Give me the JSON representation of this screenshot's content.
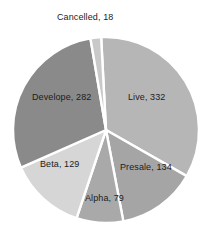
{
  "chart_data": {
    "type": "pie",
    "title": "",
    "subtitle": "",
    "xlabel": "",
    "ylabel": "",
    "legend_position": "none",
    "grid": false,
    "label_format": "category, value",
    "total": 974,
    "start_angle_deg": -3,
    "direction": "clockwise",
    "categories": [
      "Live",
      "Presale",
      "Alpha",
      "Beta",
      "Develope",
      "Cancelled"
    ],
    "values": [
      332,
      134,
      79,
      129,
      282,
      18
    ],
    "colors": [
      "#b6b6b6",
      "#a5a5a5",
      "#a9a9a9",
      "#d6d6d6",
      "#8a8a8a",
      "#c9c9c9"
    ],
    "slices": [
      {
        "name": "live-slice",
        "category": "Live",
        "value": 332,
        "label": "Live, 332",
        "color": "#b6b6b6",
        "label_x": 128,
        "label_y": 93
      },
      {
        "name": "presale-slice",
        "category": "Presale",
        "value": 134,
        "label": "Presale, 134",
        "color": "#a5a5a5",
        "label_x": 120,
        "label_y": 163
      },
      {
        "name": "alpha-slice",
        "category": "Alpha",
        "value": 79,
        "label": "Alpha, 79",
        "color": "#a9a9a9",
        "label_x": 85,
        "label_y": 194
      },
      {
        "name": "beta-slice",
        "category": "Beta",
        "value": 129,
        "label": "Beta, 129",
        "color": "#d6d6d6",
        "label_x": 40,
        "label_y": 160
      },
      {
        "name": "develope-slice",
        "category": "Develope",
        "value": 282,
        "label": "Develope, 282",
        "color": "#8a8a8a",
        "label_x": 32,
        "label_y": 93
      },
      {
        "name": "cancelled-slice",
        "category": "Cancelled",
        "value": 18,
        "label": "Cancelled, 18",
        "color": "#c9c9c9",
        "label_x": 57,
        "label_y": 13
      }
    ],
    "geometry": {
      "center_x": 106,
      "center_y": 130,
      "radius": 93,
      "separator_color": "#ffffff",
      "separator_width": 2.4,
      "background": "#ffffff"
    }
  }
}
